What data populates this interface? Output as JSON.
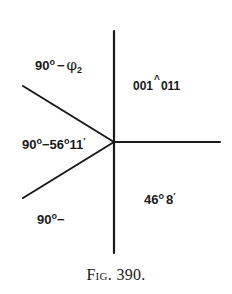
{
  "figure": {
    "caption": "Fig. 390.",
    "line_color": "#1a1a1a",
    "center": {
      "x": 114,
      "y": 142
    },
    "lines": [
      {
        "name": "vertical-up",
        "x1": 114,
        "y1": 142,
        "x2": 114,
        "y2": 31
      },
      {
        "name": "vertical-down",
        "x1": 114,
        "y1": 142,
        "x2": 114,
        "y2": 253
      },
      {
        "name": "horizontal-right",
        "x1": 114,
        "y1": 142,
        "x2": 220,
        "y2": 142
      },
      {
        "name": "upper-left",
        "x1": 114,
        "y1": 142,
        "x2": 23,
        "y2": 86
      },
      {
        "name": "lower-left",
        "x1": 114,
        "y1": 142,
        "x2": 23,
        "y2": 198
      }
    ]
  },
  "labels": {
    "upper_left": {
      "base": "90",
      "deg": "o",
      "dash": "−",
      "phi": "φ",
      "sub": "2"
    },
    "upper_right": {
      "left": "001",
      "caret": "^",
      "right": "011"
    },
    "middle_left": {
      "a": "90",
      "deg1": "o",
      "dash": "−",
      "b": "56",
      "deg2": "o",
      "c": "11",
      "prime": "′"
    },
    "lower_right": {
      "a": "46",
      "deg": "o",
      "b": "8",
      "prime": "′"
    },
    "lower_left": {
      "a": "90",
      "deg": "o",
      "dash": "−"
    }
  }
}
